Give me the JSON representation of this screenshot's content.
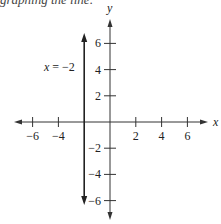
{
  "header": {
    "partial_text": "graphing the line:"
  },
  "chart_data": {
    "type": "line",
    "title": "",
    "xlabel": "x",
    "ylabel": "y",
    "xlim": [
      -7.5,
      7.5
    ],
    "ylim": [
      -7.5,
      7.5
    ],
    "x_ticks": [
      -6,
      -4,
      2,
      4,
      6
    ],
    "y_ticks": [
      6,
      4,
      2,
      -2,
      -4,
      -6
    ],
    "x_tick_labels": [
      "−6",
      "−4",
      "2",
      "4",
      "6"
    ],
    "y_tick_labels": [
      "6",
      "4",
      "2",
      "−2",
      "−4",
      "−6"
    ],
    "grid": false,
    "series": [
      {
        "name": "x = −2",
        "equation": "x = -2",
        "points": [
          [
            -2,
            6.8
          ],
          [
            -2,
            -6.2
          ]
        ],
        "color": "#222222"
      }
    ],
    "annotations": [
      {
        "text": "x = −2",
        "x": -5,
        "y": 3.5
      }
    ]
  }
}
